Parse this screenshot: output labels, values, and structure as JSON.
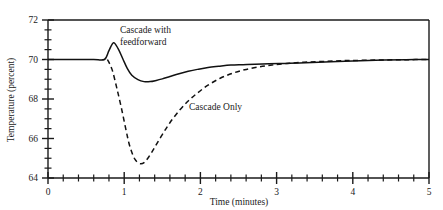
{
  "chart_data": {
    "type": "line",
    "title": "",
    "xlabel": "Time (minutes)",
    "ylabel": "Temperature (percent)",
    "xlim": [
      0,
      5
    ],
    "ylim": [
      64,
      72
    ],
    "grid": false,
    "legend_position": "inline-annotations",
    "x_major_ticks": [
      0,
      1,
      2,
      3,
      4,
      5
    ],
    "x_major_tick_labels": [
      "0",
      "1",
      "2",
      "3",
      "4",
      "5"
    ],
    "x_minor_tick_step": 0.2,
    "y_major_ticks": [
      64,
      66,
      68,
      70,
      72
    ],
    "y_major_tick_labels": [
      "64",
      "66",
      "68",
      "70",
      "72"
    ],
    "y_minor_tick_step": 0.5,
    "setpoint": 70,
    "series": [
      {
        "name": "Cascade with feedforward",
        "style": "solid",
        "color": "#111111",
        "annotation": "Cascade with\nfeedforward",
        "annotation_line1": "Cascade with",
        "annotation_line2": "feedforward",
        "x": [
          0.0,
          0.2,
          0.4,
          0.6,
          0.74,
          0.8,
          0.86,
          0.92,
          0.98,
          1.04,
          1.1,
          1.18,
          1.26,
          1.34,
          1.42,
          1.5,
          1.6,
          1.72,
          1.84,
          1.96,
          2.1,
          2.24,
          2.4,
          2.56,
          2.72,
          2.9,
          3.1,
          3.3,
          3.55,
          3.8,
          4.1,
          4.4,
          4.7,
          5.0
        ],
        "y": [
          70.0,
          70.0,
          70.0,
          70.0,
          70.0,
          70.45,
          70.85,
          70.55,
          70.05,
          69.55,
          69.2,
          68.98,
          68.88,
          68.88,
          68.94,
          69.02,
          69.14,
          69.28,
          69.4,
          69.5,
          69.6,
          69.66,
          69.72,
          69.74,
          69.76,
          69.78,
          69.8,
          69.82,
          69.86,
          69.9,
          69.94,
          69.97,
          69.99,
          70.0
        ]
      },
      {
        "name": "Cascade Only",
        "style": "dashed",
        "color": "#111111",
        "annotation": "Cascade Only",
        "x": [
          0.78,
          0.84,
          0.9,
          0.96,
          1.02,
          1.06,
          1.1,
          1.14,
          1.18,
          1.22,
          1.26,
          1.32,
          1.4,
          1.5,
          1.6,
          1.72,
          1.84,
          1.96,
          2.1,
          2.26,
          2.42,
          2.58,
          2.76,
          2.94,
          3.14,
          3.36,
          3.6,
          3.86,
          4.14,
          4.44,
          4.72,
          5.0
        ],
        "y": [
          70.0,
          69.5,
          68.6,
          67.6,
          66.5,
          65.8,
          65.3,
          64.95,
          64.78,
          64.72,
          64.78,
          65.05,
          65.55,
          66.2,
          66.8,
          67.4,
          67.9,
          68.3,
          68.7,
          69.05,
          69.3,
          69.48,
          69.62,
          69.72,
          69.8,
          69.86,
          69.9,
          69.94,
          69.96,
          69.98,
          69.99,
          70.0
        ]
      }
    ]
  }
}
